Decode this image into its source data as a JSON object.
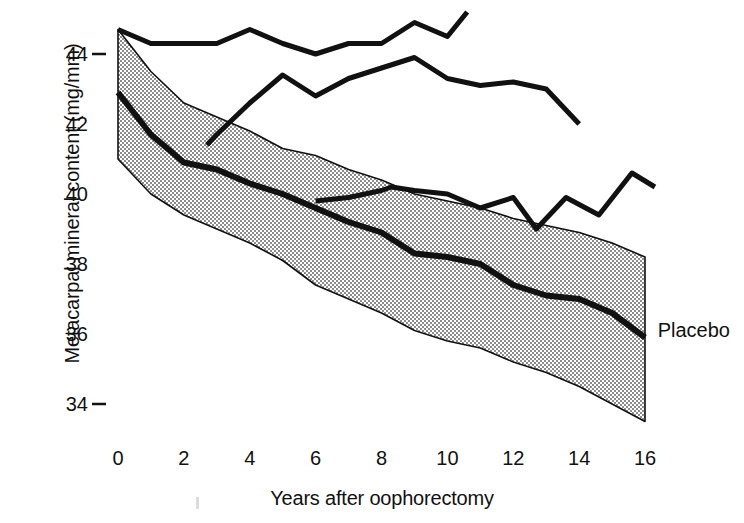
{
  "chart_data": {
    "type": "line",
    "title": "",
    "xlabel": "Years after oophorectomy",
    "ylabel": "Metacarpal mineral content (mg/mm)",
    "xlim": [
      0,
      17.2
    ],
    "ylim": [
      33.0,
      45.2
    ],
    "xticks": [
      0,
      2,
      4,
      6,
      8,
      10,
      12,
      14,
      16
    ],
    "yticks": [
      34,
      36,
      38,
      40,
      42,
      44
    ],
    "grid": false,
    "legend_position": "inline-right",
    "annotations": [
      {
        "text": "Placebo",
        "x": 16.2,
        "y": 36.1
      }
    ],
    "series": [
      {
        "name": "Placebo mean",
        "style": "thick-solid",
        "x": [
          0,
          1,
          2,
          3,
          4,
          5,
          6,
          7,
          8,
          9,
          10,
          11,
          12,
          13,
          14,
          15,
          16
        ],
        "values": [
          42.9,
          41.7,
          40.9,
          40.7,
          40.3,
          40.0,
          39.6,
          39.2,
          38.9,
          38.3,
          38.2,
          38.0,
          37.4,
          37.1,
          37.0,
          36.6,
          35.9
        ]
      },
      {
        "name": "Placebo upper band limit",
        "style": "stippled-band-edge",
        "x": [
          0,
          1,
          2,
          3,
          4,
          5,
          6,
          7,
          8,
          9,
          10,
          11,
          12,
          13,
          14,
          15,
          16
        ],
        "values": [
          44.7,
          43.5,
          42.6,
          42.2,
          41.8,
          41.3,
          41.1,
          40.7,
          40.4,
          40.0,
          39.8,
          39.6,
          39.3,
          39.1,
          38.9,
          38.6,
          38.2
        ]
      },
      {
        "name": "Placebo lower band limit",
        "style": "stippled-band-edge",
        "x": [
          0,
          1,
          2,
          3,
          4,
          5,
          6,
          7,
          8,
          9,
          10,
          11,
          12,
          13,
          14,
          15,
          16
        ],
        "values": [
          41.0,
          40.0,
          39.4,
          39.0,
          38.6,
          38.1,
          37.4,
          37.0,
          36.6,
          36.1,
          35.8,
          35.6,
          35.2,
          34.9,
          34.5,
          34.0,
          33.5
        ]
      },
      {
        "name": "Treated group A",
        "style": "thick-solid",
        "x": [
          0,
          1,
          2,
          3,
          4,
          5,
          6,
          7,
          8,
          9,
          10,
          10.6
        ],
        "values": [
          44.7,
          44.3,
          44.3,
          44.3,
          44.7,
          44.3,
          44.0,
          44.3,
          44.3,
          44.9,
          44.5,
          45.2
        ]
      },
      {
        "name": "Treated group B",
        "style": "thick-solid",
        "x": [
          2.7,
          3,
          4,
          5,
          6,
          7,
          8,
          9,
          10,
          11,
          12,
          13,
          14
        ],
        "values": [
          41.4,
          41.7,
          42.6,
          43.4,
          42.8,
          43.3,
          43.6,
          43.9,
          43.3,
          43.1,
          43.2,
          43.0,
          42.0
        ]
      },
      {
        "name": "Treated group C",
        "style": "thick-solid",
        "x": [
          6,
          7,
          8,
          8.3,
          9,
          10,
          11,
          12,
          12.7,
          13.6,
          14.6,
          15.6,
          16.3
        ],
        "values": [
          39.8,
          39.9,
          40.1,
          40.2,
          40.1,
          40.0,
          39.6,
          39.9,
          39.0,
          39.9,
          39.4,
          40.6,
          40.2
        ]
      }
    ]
  },
  "axis": {
    "ylabel": "Metacarpal mineral content (mg/mm)",
    "xlabel": "Years after oophorectomy"
  },
  "labels": {
    "placebo": "Placebo"
  },
  "colors": {
    "line": "#111111",
    "band_fill": "#b9b9b9",
    "background": "#ffffff",
    "axis": "#111111"
  }
}
